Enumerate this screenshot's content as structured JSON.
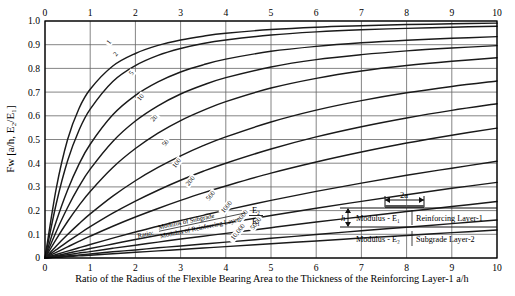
{
  "chart_data": {
    "type": "line",
    "title": "",
    "xlabel": "Ratio of the Radius of the Flexible Bearing Area to the Thickness of the Reinforcing Layer-1   a/h",
    "ylabel": "Fᴡ [a/h, E₂/E₁]",
    "xlim": [
      0,
      10
    ],
    "ylim": [
      0,
      1.0
    ],
    "grid": true,
    "xticks": [
      0,
      1,
      2,
      3,
      4,
      5,
      6,
      7,
      8,
      9,
      10
    ],
    "xticklabels": [
      "0",
      "1",
      "2",
      "3",
      "4",
      "5",
      "6",
      "7",
      "8",
      "9",
      "10"
    ],
    "yticks": [
      0,
      0.1,
      0.2,
      0.3,
      0.4,
      0.5,
      0.6,
      0.7,
      0.8,
      0.9,
      1.0
    ],
    "yticklabels": [
      "0",
      "0.1",
      "0.2",
      "0.3",
      "0.4",
      "0.5",
      "0.6",
      "0.7",
      "0.8",
      "0.9",
      "1.0"
    ],
    "top_axis_labels": [
      "0",
      "1",
      "2",
      "3",
      "4",
      "5",
      "6",
      "7",
      "8",
      "9",
      "10"
    ],
    "legend_position": "inline-curve-labels",
    "curve_label_note": "Ratio: Modulus of Subgrade / Modulus of Reinforcing Layer",
    "curve_label_symbol": "E₂/E₁",
    "x": [
      0,
      0.25,
      0.5,
      0.75,
      1,
      1.5,
      2,
      2.5,
      3,
      3.5,
      4,
      5,
      6,
      7,
      8,
      9,
      10
    ],
    "series": [
      {
        "name": "1",
        "values": [
          0,
          0.295,
          0.5,
          0.63,
          0.712,
          0.81,
          0.863,
          0.897,
          0.92,
          0.936,
          0.948,
          0.964,
          0.974,
          0.98,
          0.985,
          0.988,
          0.991
        ]
      },
      {
        "name": "2",
        "values": [
          0,
          0.23,
          0.41,
          0.538,
          0.628,
          0.745,
          0.812,
          0.855,
          0.884,
          0.905,
          0.92,
          0.941,
          0.954,
          0.963,
          0.969,
          0.974,
          0.978
        ]
      },
      {
        "name": "5",
        "values": [
          0,
          0.155,
          0.287,
          0.395,
          0.48,
          0.604,
          0.686,
          0.743,
          0.785,
          0.815,
          0.839,
          0.872,
          0.893,
          0.908,
          0.919,
          0.927,
          0.934
        ]
      },
      {
        "name": "10",
        "values": [
          0,
          0.112,
          0.213,
          0.301,
          0.375,
          0.492,
          0.578,
          0.642,
          0.692,
          0.73,
          0.761,
          0.806,
          0.837,
          0.858,
          0.874,
          0.886,
          0.896
        ]
      },
      {
        "name": "20",
        "values": [
          0,
          0.08,
          0.154,
          0.221,
          0.281,
          0.382,
          0.462,
          0.527,
          0.58,
          0.623,
          0.66,
          0.717,
          0.758,
          0.789,
          0.812,
          0.83,
          0.845
        ]
      },
      {
        "name": "50",
        "values": [
          0,
          0.051,
          0.099,
          0.144,
          0.186,
          0.261,
          0.326,
          0.382,
          0.431,
          0.474,
          0.511,
          0.574,
          0.624,
          0.664,
          0.697,
          0.724,
          0.747
        ]
      },
      {
        "name": "100",
        "values": [
          0,
          0.035,
          0.069,
          0.101,
          0.132,
          0.189,
          0.24,
          0.286,
          0.328,
          0.366,
          0.4,
          0.46,
          0.511,
          0.554,
          0.591,
          0.623,
          0.651
        ]
      },
      {
        "name": "200",
        "values": [
          0,
          0.024,
          0.047,
          0.07,
          0.092,
          0.134,
          0.173,
          0.209,
          0.243,
          0.275,
          0.304,
          0.358,
          0.405,
          0.447,
          0.485,
          0.518,
          0.548
        ]
      },
      {
        "name": "500",
        "values": [
          0,
          0.015,
          0.029,
          0.043,
          0.057,
          0.084,
          0.11,
          0.134,
          0.158,
          0.18,
          0.202,
          0.243,
          0.281,
          0.316,
          0.349,
          0.379,
          0.408
        ]
      },
      {
        "name": "1000",
        "values": [
          0,
          0.01,
          0.02,
          0.03,
          0.04,
          0.059,
          0.078,
          0.096,
          0.113,
          0.13,
          0.147,
          0.179,
          0.21,
          0.239,
          0.267,
          0.294,
          0.319
        ]
      },
      {
        "name": "2000",
        "values": [
          0,
          0.007,
          0.014,
          0.021,
          0.027,
          0.041,
          0.054,
          0.067,
          0.08,
          0.092,
          0.104,
          0.128,
          0.152,
          0.174,
          0.196,
          0.217,
          0.238
        ]
      },
      {
        "name": "5000",
        "values": [
          0,
          0.004,
          0.009,
          0.013,
          0.017,
          0.026,
          0.034,
          0.043,
          0.051,
          0.059,
          0.067,
          0.083,
          0.099,
          0.115,
          0.13,
          0.145,
          0.16
        ]
      },
      {
        "name": "10,000",
        "values": [
          0,
          0.003,
          0.006,
          0.009,
          0.012,
          0.018,
          0.024,
          0.03,
          0.036,
          0.042,
          0.048,
          0.06,
          0.072,
          0.084,
          0.095,
          0.107,
          0.118
        ]
      }
    ],
    "curve_labels": [
      {
        "name": "1",
        "x": 1.45,
        "y": 0.905
      },
      {
        "name": "2",
        "x": 1.6,
        "y": 0.855
      },
      {
        "name": "5",
        "x": 1.95,
        "y": 0.775
      },
      {
        "name": "10",
        "x": 2.15,
        "y": 0.672
      },
      {
        "name": "20",
        "x": 2.45,
        "y": 0.585
      },
      {
        "name": "50",
        "x": 2.7,
        "y": 0.48
      },
      {
        "name": "100",
        "x": 2.95,
        "y": 0.395
      },
      {
        "name": "200",
        "x": 3.25,
        "y": 0.32
      },
      {
        "name": "500",
        "x": 3.7,
        "y": 0.258
      },
      {
        "name": "1000",
        "x": 4.05,
        "y": 0.21
      },
      {
        "name": "2000",
        "x": 4.4,
        "y": 0.172
      },
      {
        "name": "5000",
        "x": 4.7,
        "y": 0.14
      },
      {
        "name": "10,000",
        "x": 4.3,
        "y": 0.105
      }
    ]
  },
  "inset": {
    "width_label": "2a",
    "thickness_label": "h",
    "layer1_modulus": "Modulus - E₁",
    "layer1_name": "Reinforcing Layer-1",
    "layer2_modulus": "Modulus - E₂",
    "layer2_name": "Subgrade Layer-2"
  },
  "colors": {
    "curve": "#1a1a1a",
    "grid": "#666666",
    "axis": "#000000",
    "background": "#ffffff"
  }
}
